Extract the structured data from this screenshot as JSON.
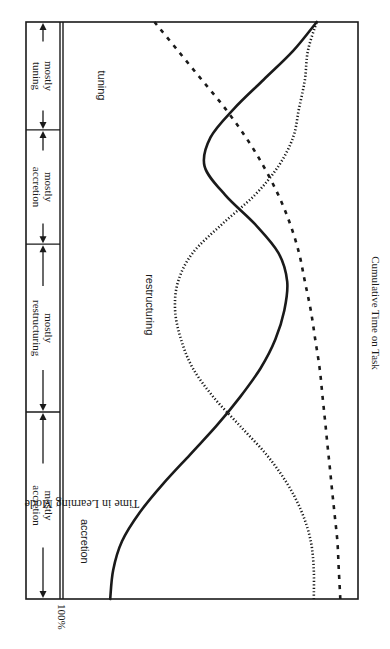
{
  "chart_data": {
    "type": "line",
    "orientation": "rotated-90-clockwise",
    "title": "",
    "xlabel": "Cumulative Time on Task",
    "ylabel": "Time in Learning Mode",
    "y_tick_labels": [
      "100%"
    ],
    "ylim": [
      0,
      100
    ],
    "xlim": [
      0,
      1
    ],
    "grid": false,
    "legend": "inline labels on curves",
    "x": [
      0.0,
      0.05,
      0.1,
      0.15,
      0.2,
      0.25,
      0.3,
      0.35,
      0.4,
      0.45,
      0.5,
      0.55,
      0.6,
      0.65,
      0.7,
      0.75,
      0.8,
      0.85,
      0.9,
      0.95,
      1.0
    ],
    "series": [
      {
        "name": "accretion",
        "style": "solid",
        "values": [
          84,
          83,
          80,
          74,
          66,
          57,
          48,
          40,
          33,
          28,
          25,
          24,
          27,
          35,
          45,
          52,
          50,
          42,
          32,
          22,
          14
        ]
      },
      {
        "name": "restructuring",
        "style": "dotted",
        "values": [
          15,
          15,
          16,
          19,
          24,
          31,
          40,
          49,
          56,
          60,
          62,
          61,
          56,
          46,
          35,
          27,
          22,
          20,
          18,
          17,
          14
        ]
      },
      {
        "name": "tuning",
        "style": "dashed",
        "values": [
          6,
          6.5,
          7,
          8,
          9,
          10,
          11,
          12,
          13,
          14.5,
          16,
          18,
          20,
          23,
          27,
          32,
          38,
          45,
          53,
          61,
          69
        ]
      }
    ],
    "phases": [
      {
        "label_line1": "mostly",
        "label_line2": "accretion",
        "start": 0.0,
        "end": 0.324
      },
      {
        "label_line1": "mostly",
        "label_line2": "restructuring",
        "start": 0.324,
        "end": 0.615
      },
      {
        "label_line1": "mostly",
        "label_line2": "accretion",
        "start": 0.615,
        "end": 0.813
      },
      {
        "label_line1": "mostly",
        "label_line2": "tuning",
        "start": 0.813,
        "end": 1.0
      }
    ],
    "curve_labels": [
      {
        "series": "accretion",
        "text": "accretion",
        "t": 0.1,
        "p": 94
      },
      {
        "series": "restructuring",
        "text": "restructuring",
        "t": 0.51,
        "p": 72
      },
      {
        "series": "tuning",
        "text": "tuning",
        "t": 0.89,
        "p": 88
      }
    ]
  },
  "labels": {
    "y_tick_100": "100%",
    "y_axis": "Time in Learning Mode",
    "x_axis": "Cumulative Time on Task"
  },
  "colors": {
    "ink": "#1a1a1a",
    "background": "#ffffff"
  }
}
